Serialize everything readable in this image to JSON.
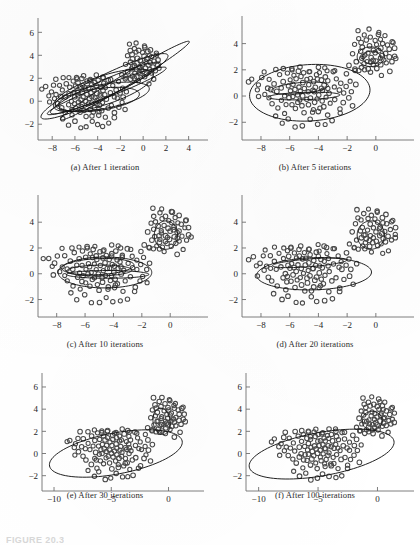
{
  "figure": {
    "caption_fragment": "FIGURE 20.3",
    "panel_count": 6
  },
  "panels": [
    {
      "id": "a",
      "caption": "(a)  After 1 iteration",
      "iteration": 1,
      "xticks": [
        -8,
        -6,
        -4,
        -2,
        0,
        2,
        4
      ],
      "yticks": [
        -2,
        0,
        2,
        4,
        6
      ],
      "xlim": [
        -9.6,
        5.0
      ],
      "ylim": [
        -3.2,
        6.9
      ]
    },
    {
      "id": "b",
      "caption": "(b)  After 5 iterations",
      "iteration": 5,
      "xticks": [
        -8,
        -6,
        -4,
        -2,
        0
      ],
      "yticks": [
        -2,
        0,
        2,
        4
      ],
      "xlim": [
        -9.6,
        2.1
      ],
      "ylim": [
        -3.2,
        5.8
      ]
    },
    {
      "id": "c",
      "caption": "(c)  After 10 iterations",
      "iteration": 10,
      "xticks": [
        -8,
        -6,
        -4,
        -2,
        0
      ],
      "yticks": [
        -2,
        0,
        2,
        4
      ],
      "xlim": [
        -9.6,
        2.1
      ],
      "ylim": [
        -3.2,
        5.8
      ]
    },
    {
      "id": "d",
      "caption": "(d)  After 20 iterations",
      "iteration": 20,
      "xticks": [
        -8,
        -6,
        -4,
        -2,
        0
      ],
      "yticks": [
        -2,
        0,
        2,
        4
      ],
      "xlim": [
        -9.6,
        2.1
      ],
      "ylim": [
        -3.2,
        5.8
      ]
    },
    {
      "id": "e",
      "caption": "(e)  After 30 iterations",
      "iteration": 30,
      "xticks": [
        -10,
        -5,
        0
      ],
      "yticks": [
        -2,
        0,
        2,
        4,
        6
      ],
      "xlim": [
        -11.4,
        2.4
      ],
      "ylim": [
        -3.2,
        6.9
      ]
    },
    {
      "id": "f",
      "caption": "(f)  After 100 iterations",
      "iteration": 100,
      "xticks": [
        -10,
        -5,
        0
      ],
      "yticks": [
        -2,
        0,
        2,
        4,
        6
      ],
      "xlim": [
        -11.4,
        2.4
      ],
      "ylim": [
        -3.2,
        6.9
      ]
    }
  ],
  "chart_data": {
    "type": "scatter",
    "xlabel": "",
    "ylabel": "",
    "grid": false,
    "legend": null,
    "marker": "open-circle",
    "marker_color": "#4a4a4a",
    "ellipse_color": "#141414",
    "cluster_left": {
      "name": "left cluster",
      "n": 120,
      "x": [
        -8.9,
        -8.6,
        -8.3,
        -8.2,
        -8.1,
        -7.9,
        -7.8,
        -7.7,
        -7.6,
        -7.5,
        -7.4,
        -7.3,
        -7.2,
        -7.1,
        -7.0,
        -6.9,
        -6.8,
        -6.7,
        -6.6,
        -6.5,
        -6.4,
        -6.35,
        -6.3,
        -6.2,
        -6.15,
        -6.1,
        -6.0,
        -5.95,
        -5.9,
        -5.85,
        -5.8,
        -5.75,
        -5.7,
        -5.65,
        -5.6,
        -5.55,
        -5.5,
        -5.45,
        -5.4,
        -5.35,
        -5.3,
        -5.25,
        -5.2,
        -5.15,
        -5.1,
        -5.05,
        -5.0,
        -4.95,
        -4.9,
        -4.85,
        -4.8,
        -4.75,
        -4.7,
        -4.65,
        -4.6,
        -4.55,
        -4.5,
        -4.45,
        -4.4,
        -4.35,
        -4.3,
        -4.25,
        -4.2,
        -4.15,
        -4.1,
        -4.05,
        -4.0,
        -3.95,
        -3.9,
        -3.85,
        -3.8,
        -3.75,
        -3.7,
        -3.65,
        -3.6,
        -3.55,
        -3.5,
        -3.45,
        -3.4,
        -3.35,
        -3.3,
        -3.2,
        -3.1,
        -3.0,
        -2.9,
        -2.8,
        -2.7,
        -2.6,
        -2.5,
        -2.4,
        -2.3,
        -2.2,
        -2.1,
        -2.0,
        -1.9,
        -1.8,
        -1.7,
        -1.6,
        -1.5,
        -1.4,
        -7.05,
        -6.55,
        -6.05,
        -5.55,
        -5.05,
        -4.55,
        -4.05,
        -3.55,
        -3.05,
        -2.55,
        -6.45,
        -5.85,
        -5.25,
        -4.65,
        -4.05,
        -3.45,
        -2.85,
        -6.25,
        -4.45,
        -3.85
      ],
      "y": [
        1.1,
        1.25,
        0.55,
        -0.1,
        0.85,
        1.4,
        0.2,
        1.9,
        0.55,
        -0.2,
        1.35,
        0.45,
        -0.55,
        0.95,
        2.0,
        0.3,
        -0.9,
        1.6,
        0.6,
        -0.35,
        1.15,
        0.05,
        -1.25,
        1.8,
        0.7,
        -0.15,
        1.3,
        0.4,
        -0.65,
        2.05,
        0.85,
        -0.05,
        1.55,
        0.5,
        -1.0,
        1.25,
        0.15,
        -0.45,
        1.95,
        0.75,
        -0.25,
        1.45,
        0.35,
        -0.8,
        1.1,
        0.0,
        -1.35,
        1.7,
        0.65,
        -0.3,
        1.2,
        0.25,
        -0.7,
        1.85,
        0.8,
        -0.1,
        1.4,
        0.45,
        -0.95,
        1.05,
        0.35,
        -0.5,
        1.6,
        0.7,
        -0.2,
        1.3,
        0.1,
        -1.15,
        1.75,
        0.6,
        -0.4,
        1.15,
        0.4,
        -0.85,
        2.15,
        0.9,
        -0.05,
        1.5,
        0.55,
        -1.4,
        1.25,
        0.2,
        -0.6,
        1.9,
        0.75,
        -0.3,
        1.35,
        0.45,
        -1.05,
        1.0,
        0.3,
        -0.5,
        1.65,
        0.7,
        -0.15,
        1.2,
        0.35,
        -0.75,
        2.1,
        0.85,
        -1.55,
        -2.05,
        -1.7,
        -2.3,
        -2.25,
        -1.8,
        -2.1,
        -2.15,
        -1.95,
        -1.35,
        2.05,
        1.95,
        2.15,
        1.85,
        2.25,
        2.0,
        1.9,
        -0.65,
        -1.25,
        -0.9,
        0.55,
        1.15,
        -0.35,
        0.95,
        -1.15,
        0.25,
        1.45
      ]
    },
    "cluster_right": {
      "name": "right cluster",
      "n": 60,
      "x": [
        -1.8,
        -1.6,
        -1.5,
        -1.4,
        -1.3,
        -1.2,
        -1.15,
        -1.1,
        -1.05,
        -1.0,
        -0.95,
        -0.9,
        -0.85,
        -0.8,
        -0.75,
        -0.7,
        -0.65,
        -0.6,
        -0.55,
        -0.5,
        -0.45,
        -0.4,
        -0.35,
        -0.3,
        -0.25,
        -0.2,
        -0.15,
        -0.1,
        -0.05,
        0.0,
        0.05,
        0.1,
        0.15,
        0.2,
        0.25,
        0.3,
        0.35,
        0.4,
        0.45,
        0.5,
        0.55,
        0.6,
        0.7,
        0.8,
        0.9,
        1.0,
        1.1,
        1.2,
        1.3,
        1.4,
        -1.25,
        -0.55,
        0.15,
        0.65,
        1.15,
        -0.35,
        0.45,
        0.95,
        -0.75,
        1.35
      ],
      "y": [
        2.3,
        3.2,
        2.0,
        3.9,
        2.6,
        4.4,
        1.9,
        3.4,
        2.85,
        4.1,
        2.2,
        3.65,
        2.95,
        4.65,
        2.45,
        3.1,
        2.7,
        4.25,
        3.35,
        2.05,
        3.8,
        2.55,
        4.5,
        3.0,
        2.35,
        3.55,
        2.8,
        4.2,
        3.25,
        2.6,
        3.95,
        2.15,
        4.75,
        3.45,
        2.9,
        3.7,
        2.4,
        4.35,
        3.15,
        2.75,
        4.0,
        3.3,
        2.5,
        3.85,
        2.95,
        3.5,
        2.65,
        4.15,
        3.05,
        2.85,
        5.05,
        5.1,
        4.85,
        4.55,
        4.05,
        1.75,
        1.55,
        1.85,
        1.95,
        3.6
      ]
    },
    "ellipses_by_panel": {
      "a": [
        {
          "cx": -3.4,
          "cy": 1.3,
          "rx": 6.2,
          "ry": 0.95,
          "angle": 26
        },
        {
          "cx": -3.3,
          "cy": 1.15,
          "rx": 5.3,
          "ry": 0.72,
          "angle": 24
        },
        {
          "cx": -3.5,
          "cy": 0.95,
          "rx": 4.6,
          "ry": 1.25,
          "angle": 18
        },
        {
          "cx": -3.6,
          "cy": 0.4,
          "rx": 4.2,
          "ry": 1.05,
          "angle": 10
        },
        {
          "cx": -3.2,
          "cy": 0.9,
          "rx": 5.6,
          "ry": 0.55,
          "angle": 21
        },
        {
          "cx": -1.6,
          "cy": 1.8,
          "rx": 6.6,
          "ry": 0.5,
          "angle": 31
        },
        {
          "cx": -3.9,
          "cy": 0.15,
          "rx": 3.6,
          "ry": 0.95,
          "angle": 8
        }
      ],
      "b": [
        {
          "cx": -4.6,
          "cy": 0.25,
          "rx": 4.2,
          "ry": 2.15,
          "angle": 4
        },
        {
          "cx": -5.3,
          "cy": 0.6,
          "rx": 2.0,
          "ry": 0.42,
          "angle": 6
        },
        {
          "cx": -5.0,
          "cy": 0.0,
          "rx": 2.5,
          "ry": 0.28,
          "angle": 2
        },
        {
          "cx": -0.35,
          "cy": 3.0,
          "rx": 0.95,
          "ry": 0.75,
          "angle": 0
        },
        {
          "cx": -0.3,
          "cy": 2.95,
          "rx": 0.62,
          "ry": 0.48,
          "angle": 0
        }
      ],
      "c": [
        {
          "cx": -4.6,
          "cy": 0.1,
          "rx": 3.3,
          "ry": 1.2,
          "angle": 0
        },
        {
          "cx": -5.1,
          "cy": 0.55,
          "rx": 2.55,
          "ry": 0.62,
          "angle": 3
        },
        {
          "cx": -5.0,
          "cy": 0.25,
          "rx": 2.3,
          "ry": 0.42,
          "angle": 1
        },
        {
          "cx": -4.4,
          "cy": -0.05,
          "rx": 2.9,
          "ry": 0.3,
          "angle": 0
        },
        {
          "cx": -0.3,
          "cy": 3.0,
          "rx": 0.82,
          "ry": 1.1,
          "angle": 0
        }
      ],
      "d": [
        {
          "cx": -4.3,
          "cy": 0.0,
          "rx": 4.0,
          "ry": 1.25,
          "angle": 2
        },
        {
          "cx": -4.6,
          "cy": 0.85,
          "rx": 2.6,
          "ry": 0.3,
          "angle": 5
        },
        {
          "cx": -0.35,
          "cy": 3.0,
          "rx": 0.95,
          "ry": 1.1,
          "angle": 0
        }
      ],
      "e": [
        {
          "cx": -4.6,
          "cy": 0.0,
          "rx": 5.9,
          "ry": 1.85,
          "angle": 11
        },
        {
          "cx": -0.6,
          "cy": 2.9,
          "rx": 0.75,
          "ry": 1.2,
          "angle": 8
        }
      ],
      "f": [
        {
          "cx": -4.7,
          "cy": -0.05,
          "rx": 6.2,
          "ry": 1.95,
          "angle": 11
        },
        {
          "cx": -0.45,
          "cy": 2.95,
          "rx": 0.85,
          "ry": 0.85,
          "angle": 0
        }
      ]
    }
  }
}
